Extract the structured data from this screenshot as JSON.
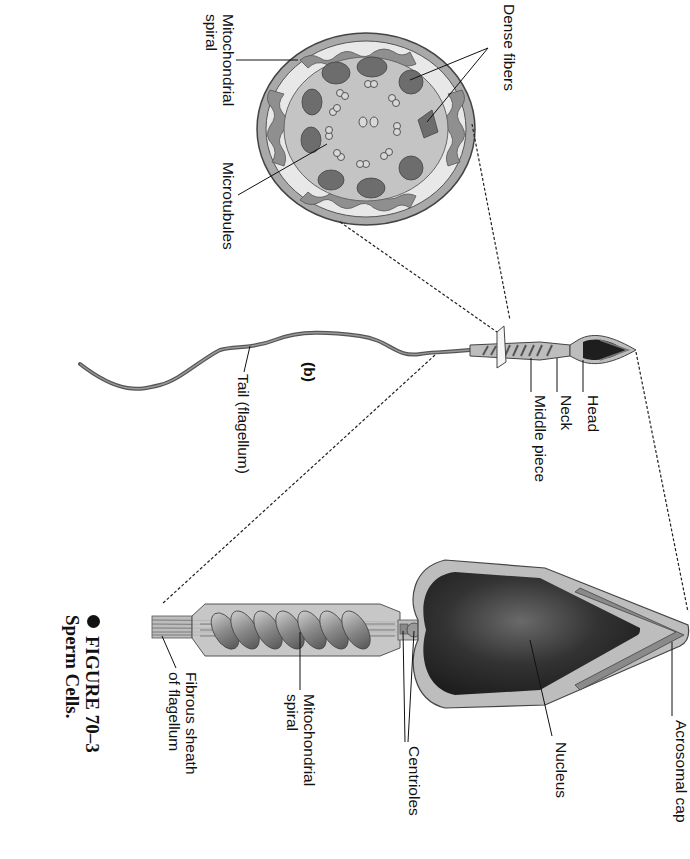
{
  "figure": {
    "number": "FIGURE 70–3",
    "title": "Sperm Cells.",
    "part_label": "(b)"
  },
  "cross_section": {
    "labels": {
      "mitochondrial_spiral": "Mitochondrial\nspiral",
      "microtubules": "Microtubules",
      "dense_fibers": "Dense fibers"
    }
  },
  "small_sperm": {
    "labels": {
      "head": "Head",
      "neck": "Neck",
      "middle_piece": "Middle piece",
      "tail": "Tail (flagellum)"
    }
  },
  "large_sperm": {
    "labels": {
      "acrosomal_cap": "Acrosomal cap",
      "nucleus": "Nucleus",
      "centrioles": "Centrioles",
      "mitochondrial_spiral": "Mitochondrial\nspiral",
      "fibrous_sheath": "Fibrous sheath\nof flagellum"
    }
  },
  "colors": {
    "outline": "#3a3a3a",
    "cytoplasm": "#b8b8b8",
    "nucleus": "#2a2a2a",
    "dense_fiber": "#6a6a6a",
    "mitochondria": "#8c8c8c"
  }
}
